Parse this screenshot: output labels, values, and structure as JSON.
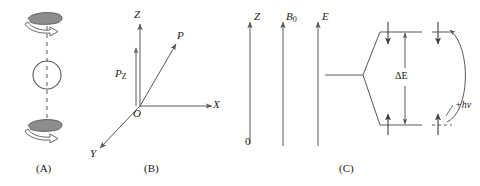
{
  "figure": {
    "caption_a": "(A)",
    "caption_b": "(B)",
    "caption_c": "(C)"
  },
  "panel_a": {
    "name": "spinning-nucleus",
    "description": "sphere on a dashed spin axis with two curved rotation arrows",
    "stroke": "#58585a",
    "axis_style": "dashed",
    "circle": {
      "cx": 47,
      "cy": 75,
      "r": 14
    },
    "arrows": [
      {
        "name": "rotation-arrow-top",
        "position": "above-sphere"
      },
      {
        "name": "rotation-arrow-bottom",
        "position": "below-sphere"
      }
    ]
  },
  "panel_b": {
    "name": "magnetic-moment-vector-axes",
    "origin_label": "O",
    "axis_z_label": "Z",
    "axis_x_label": "X",
    "axis_y_label": "Y",
    "vector_p_label": "P",
    "component_pz_label": "P",
    "component_pz_subscript": "Z",
    "stroke": "#58585a"
  },
  "panel_c": {
    "name": "zeeman-splitting-diagram",
    "axis_z_label": "Z",
    "axis_z_zero_label": "0",
    "axis_b0_label": "B",
    "axis_b0_subscript": "0",
    "axis_e_label": "E",
    "delta_e_label": "ΔE",
    "photon_label": "+hv",
    "levels": [
      {
        "name": "upper-level",
        "spin": "down"
      },
      {
        "name": "lower-level",
        "spin": "up"
      }
    ],
    "transition": {
      "name": "photon-absorption-arc",
      "direction": "up"
    },
    "stroke": "#58585a"
  },
  "colors": {
    "line": "#58585a",
    "text": "#1a1a1a",
    "arrow_fill": "#8a8a8c",
    "background": "#ffffff"
  }
}
